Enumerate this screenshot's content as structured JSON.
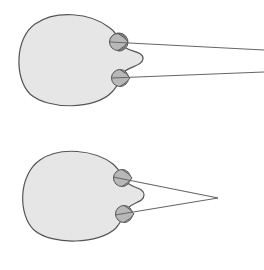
{
  "colors": {
    "background": "#ffffff",
    "head_fill": "#e6e6e6",
    "head_stroke": "#555555",
    "eye_fill": "#b8b8b8",
    "eye_stroke": "#555555",
    "sight_line": "#666666"
  },
  "figures": [
    {
      "name": "head-parallel-gaze",
      "description": "Top view of head with two eyes; sight lines run parallel toward distance",
      "eyes": [
        {
          "cx": 118,
          "cy": 42,
          "r": 9
        },
        {
          "cx": 120,
          "cy": 78,
          "r": 9
        }
      ],
      "sight_lines": [
        {
          "x1": 118,
          "y1": 42,
          "x2": 264,
          "y2": 50
        },
        {
          "x1": 120,
          "y1": 78,
          "x2": 264,
          "y2": 72
        }
      ]
    },
    {
      "name": "head-converging-gaze",
      "description": "Top view of head with two eyes; sight lines converge at a near point",
      "eyes": [
        {
          "cx": 122,
          "cy": 178,
          "r": 9
        },
        {
          "cx": 124,
          "cy": 214,
          "r": 9
        }
      ],
      "convergence_point": {
        "x": 218,
        "y": 198
      },
      "sight_lines": [
        {
          "x1": 122,
          "y1": 178,
          "x2": 218,
          "y2": 198
        },
        {
          "x1": 124,
          "y1": 214,
          "x2": 218,
          "y2": 198
        }
      ]
    }
  ]
}
